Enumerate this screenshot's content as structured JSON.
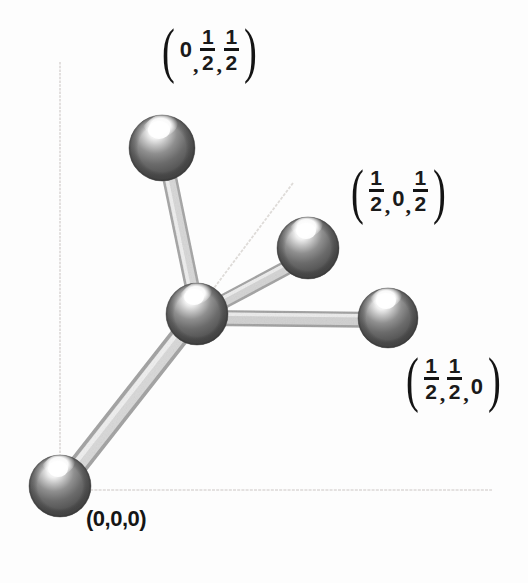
{
  "figure": {
    "kind": "fcc-lattice-point-diagram",
    "background_color": "#fdfdfd",
    "width": 528,
    "height": 583
  },
  "axes": {
    "color": "#d8d6d4",
    "vertical": {
      "x1": 60,
      "y1": 62,
      "x2": 60,
      "y2": 470
    },
    "horizontal": {
      "x1": 86,
      "y1": 490,
      "x2": 492,
      "y2": 490
    },
    "diagonal": {
      "x1": 196,
      "y1": 312,
      "x2": 292,
      "y2": 184
    }
  },
  "atoms": [
    {
      "id": "corner-origin",
      "cx": 60,
      "cy": 486,
      "r": 31,
      "label_ref": "origin"
    },
    {
      "id": "face-0-half-half",
      "cx": 162,
      "cy": 148,
      "r": 33,
      "label_ref": "0-half-half"
    },
    {
      "id": "center-atom",
      "cx": 197,
      "cy": 314,
      "r": 31,
      "label_ref": null
    },
    {
      "id": "face-half-0-half",
      "cx": 308,
      "cy": 248,
      "r": 31,
      "label_ref": "half-0-half"
    },
    {
      "id": "face-half-half-0",
      "cx": 388,
      "cy": 318,
      "r": 30,
      "label_ref": "half-half-0"
    }
  ],
  "bonds": [
    {
      "from": "center-atom",
      "to": "face-0-half-half",
      "width": 13
    },
    {
      "from": "center-atom",
      "to": "face-half-0-half",
      "width": 13
    },
    {
      "from": "center-atom",
      "to": "face-half-half-0",
      "width": 13
    },
    {
      "from": "center-atom",
      "to": "corner-origin",
      "width": 17
    }
  ],
  "colors": {
    "sphere_dark": "#4a4a4a",
    "sphere_mid": "#6e6e6e",
    "sphere_light": "#a9a9a9",
    "sphere_highlight": "#fcfcfc",
    "sphere_edge": "#3b3b3b",
    "bond_light": "#d6d6d6",
    "bond_mid": "#b9b9b9",
    "bond_dark": "#9d9d9d",
    "axis": "#d8d6d4",
    "text": "#151515"
  },
  "labels": {
    "origin": {
      "text": "(0,0,0)",
      "style": "plain"
    },
    "top": {
      "open_paren": "(",
      "close_paren": ")",
      "t1": "0",
      "sep1": ",",
      "t2_num": "1",
      "t2_den": "2",
      "sep2": ",",
      "t3_num": "1",
      "t3_den": "2"
    },
    "right_upper": {
      "open_paren": "(",
      "close_paren": ")",
      "t1_num": "1",
      "t1_den": "2",
      "sep1": ",",
      "t2": "0",
      "sep2": ",",
      "t3_num": "1",
      "t3_den": "2"
    },
    "right_lower": {
      "open_paren": "(",
      "close_paren": ")",
      "t1_num": "1",
      "t1_den": "2",
      "sep1": ",",
      "t2_num": "1",
      "t2_den": "2",
      "sep2": ",",
      "t3": "0"
    }
  }
}
